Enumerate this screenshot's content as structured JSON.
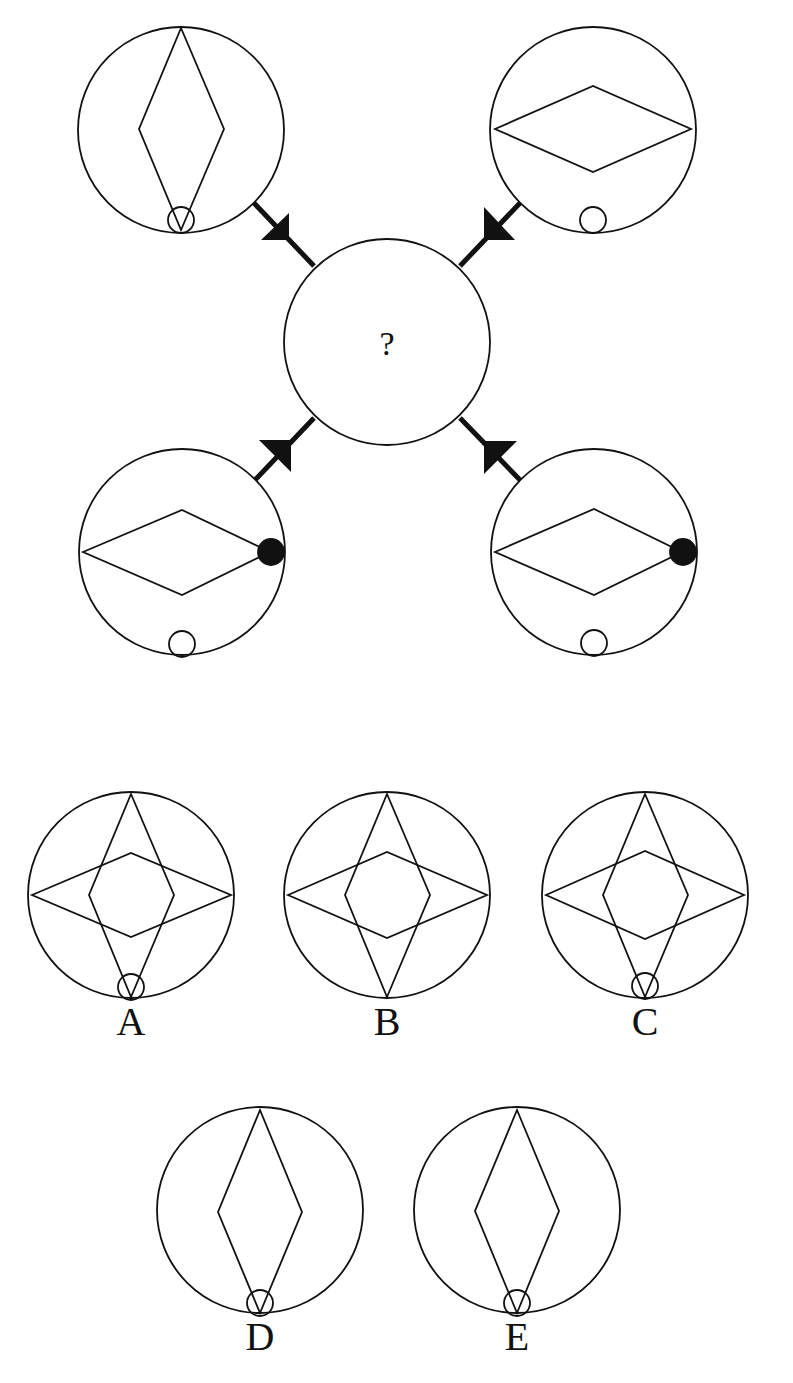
{
  "puzzle": {
    "center": {
      "label": "?"
    },
    "stroke_color": "#111111",
    "fill_color": "#111111",
    "background": "#ffffff",
    "panels": [
      {
        "id": "top-left",
        "diamond": "vertical",
        "small_circle": "bottom-inside-with-diamond-tip",
        "filled_dot": false,
        "connector": "arrow-into-center"
      },
      {
        "id": "top-right",
        "diamond": "horizontal",
        "small_circle": "bottom-inside",
        "filled_dot": false,
        "connector": "arrow-into-center"
      },
      {
        "id": "bottom-left",
        "diamond": "horizontal",
        "small_circle": "bottom-inside",
        "filled_dot": "right-vertex",
        "connector": "arrow-toward-panel"
      },
      {
        "id": "bottom-right",
        "diamond": "horizontal",
        "small_circle": "bottom-inside",
        "filled_dot": "right-vertex",
        "connector": "arrow-into-center"
      }
    ]
  },
  "options": [
    {
      "label": "A",
      "shapes": "vertical + horizontal diamond",
      "small_circle": true
    },
    {
      "label": "B",
      "shapes": "vertical + horizontal diamond",
      "small_circle": false
    },
    {
      "label": "C",
      "shapes": "vertical + horizontal diamond",
      "small_circle": true
    },
    {
      "label": "D",
      "shapes": "vertical diamond",
      "small_circle": true
    },
    {
      "label": "E",
      "shapes": "vertical diamond",
      "small_circle": true
    }
  ]
}
